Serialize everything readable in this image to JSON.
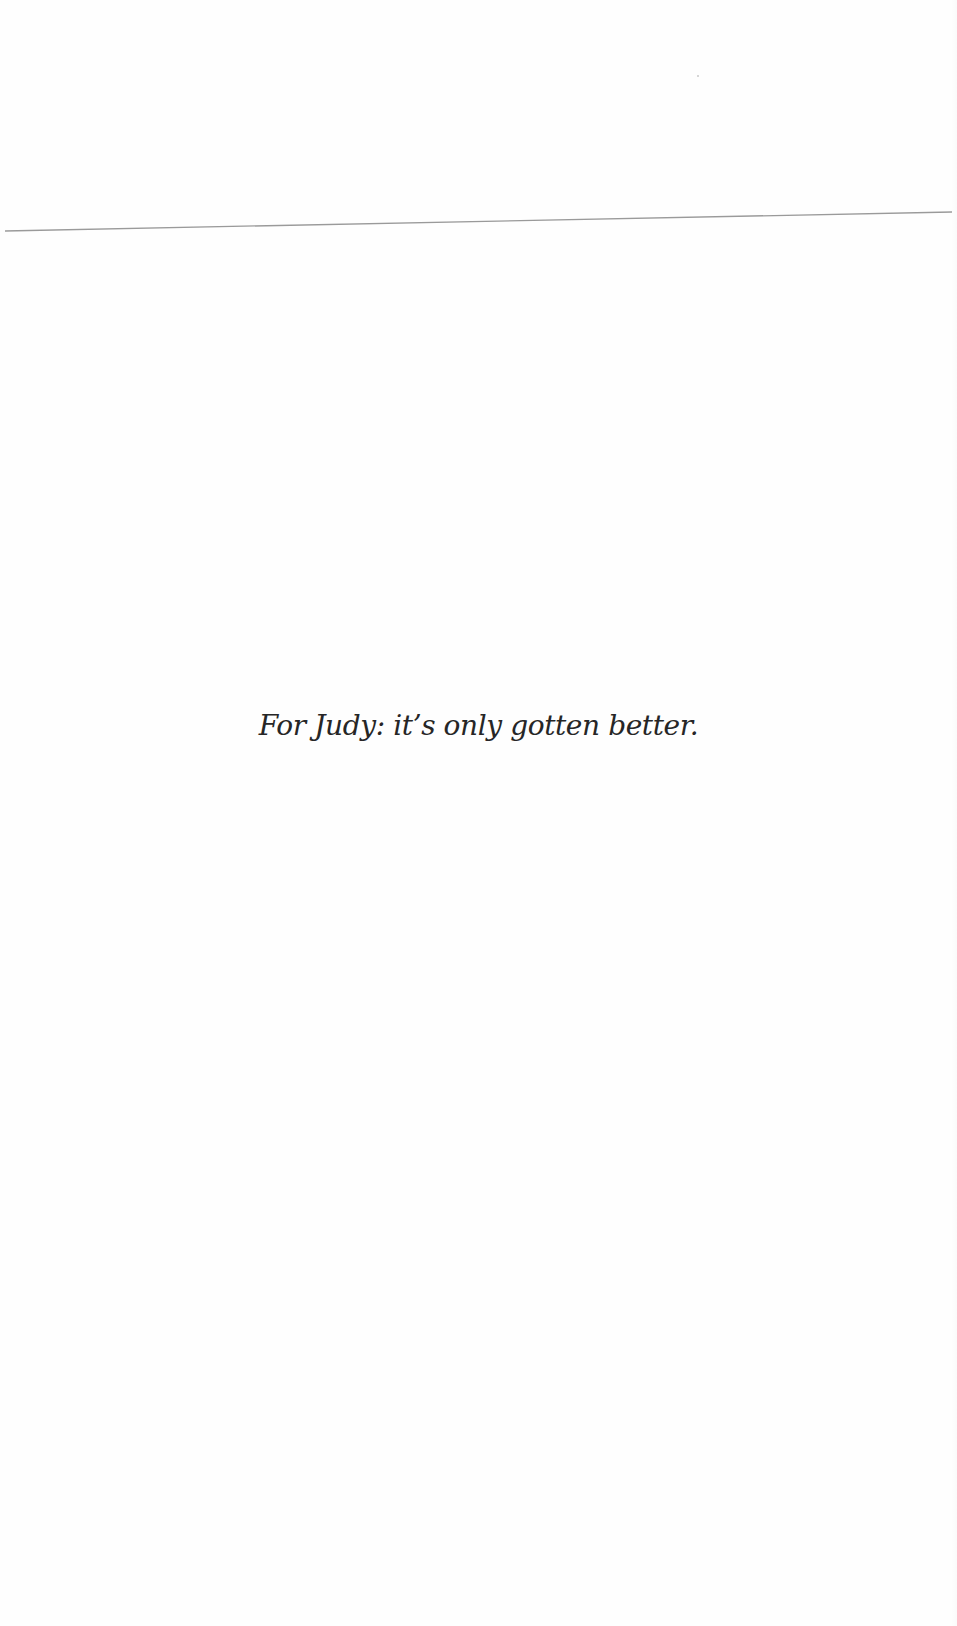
{
  "page": {
    "dedication": "For Judy: it’s only gotten better.",
    "rule": {
      "x1": 5,
      "y1": 231,
      "x2": 952,
      "y2": 212,
      "color": "#9a9a9a"
    }
  }
}
